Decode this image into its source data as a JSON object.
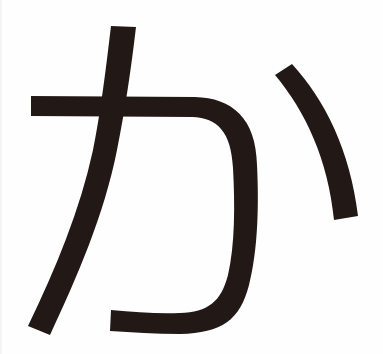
{
  "glyph": {
    "character": "か",
    "stroke_color": "#221917",
    "background_color": "#ffffff"
  }
}
